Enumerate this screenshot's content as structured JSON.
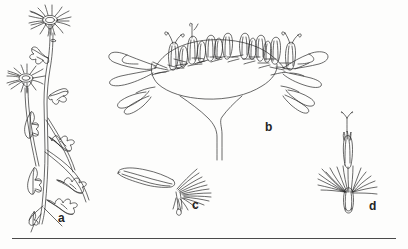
{
  "plate": {
    "background_color": "#fdfdfc",
    "ink_color": "#2a2a2a",
    "width": 408,
    "height": 249,
    "caption_rule": {
      "x": 12,
      "y": 238,
      "width": 384,
      "color": "#4a4a4a"
    }
  },
  "figures": [
    {
      "key": "a",
      "label": "a",
      "name": "habit-whole-plant",
      "label_x": 58,
      "label_y": 212
    },
    {
      "key": "b",
      "label": "b",
      "name": "receptacle-section-with-florets",
      "label_x": 265,
      "label_y": 121
    },
    {
      "key": "c",
      "label": "c",
      "name": "ray-floret-achene-with-pappus",
      "label_x": 192,
      "label_y": 199
    },
    {
      "key": "d",
      "label": "d",
      "name": "disc-floret-with-pappus",
      "label_x": 369,
      "label_y": 200
    }
  ]
}
